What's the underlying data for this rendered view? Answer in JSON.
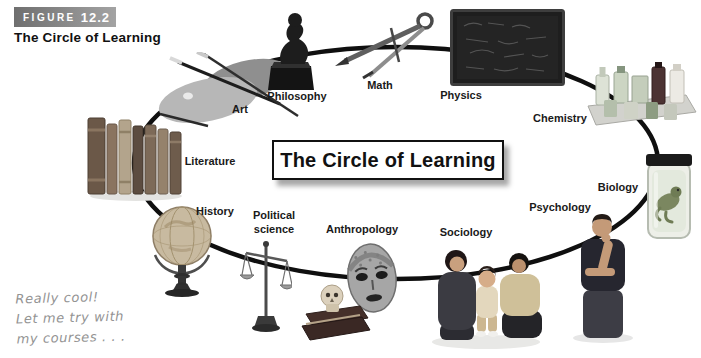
{
  "figure": {
    "tag_label": "FIGURE",
    "tag_number": "12.2",
    "caption": "The Circle of Learning"
  },
  "diagram": {
    "center_title": "The Circle of Learning",
    "disciplines": [
      {
        "label": "Art",
        "icon": "art-palette-icon"
      },
      {
        "label": "Philosophy",
        "icon": "thinker-statue-icon"
      },
      {
        "label": "Math",
        "icon": "drafting-compass-icon"
      },
      {
        "label": "Physics",
        "icon": "blackboard-icon"
      },
      {
        "label": "Chemistry",
        "icon": "reagent-bottles-icon"
      },
      {
        "label": "Biology",
        "icon": "specimen-jar-icon"
      },
      {
        "label": "Psychology",
        "icon": "thinking-person-icon"
      },
      {
        "label": "Sociology",
        "icon": "family-photo-icon"
      },
      {
        "label": "Anthropology",
        "icon": "tribal-mask-skull-icon"
      },
      {
        "label": "Political science",
        "icon": "balance-scale-icon"
      },
      {
        "label": "History",
        "icon": "globe-icon"
      },
      {
        "label": "Literature",
        "icon": "book-stack-icon"
      }
    ]
  },
  "annotation": {
    "line1": "Really cool!",
    "line2": "Let me try with",
    "line3": "my courses . . ."
  },
  "colors": {
    "figure_tag_bg_left": "#6f6f6f",
    "figure_tag_bg_right": "#a3a3a3",
    "circle_stroke": "#0f0f0f",
    "title_box_border": "#111111",
    "handwriting_text": "#939393",
    "label_text": "#1a1a1a"
  }
}
